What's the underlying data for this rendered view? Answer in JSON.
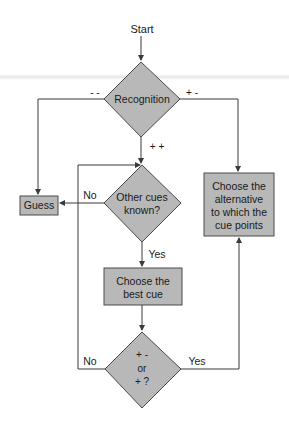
{
  "diagram": {
    "type": "flowchart",
    "colors": {
      "node_fill": "#b8b8b8",
      "node_stroke": "#4a4a4a",
      "line": "#3a3a3a",
      "text": "#1a1a1a"
    },
    "nodes": {
      "start": {
        "label": "Start"
      },
      "recognition": {
        "label": "Recognition",
        "shape": "diamond"
      },
      "guess": {
        "label": "Guess",
        "shape": "box"
      },
      "other_cues": {
        "line1": "Other cues",
        "line2": "known?",
        "shape": "diamond"
      },
      "choose_best_cue": {
        "line1": "Choose the",
        "line2": "best cue",
        "shape": "box"
      },
      "check": {
        "line1": "+ -",
        "line2": "or",
        "line3": "+ ?",
        "shape": "diamond"
      },
      "choose_alternative": {
        "line1": "Choose the",
        "line2": "alternative",
        "line3": "to which the",
        "line4": "cue points",
        "shape": "box"
      }
    },
    "edges": {
      "rec_minus_minus": "- -",
      "rec_plus_minus": "+ -",
      "rec_plus_plus": "+ +",
      "other_no": "No",
      "other_yes": "Yes",
      "check_no": "No",
      "check_yes": "Yes"
    }
  }
}
